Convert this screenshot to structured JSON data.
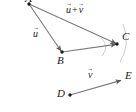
{
  "figure": {
    "type": "vector-addition-diagram",
    "width": 136,
    "height": 112,
    "background": "#ffffff",
    "line_color": "#7a7a7a",
    "arc_color": "#b8b8b8",
    "point_color": "#1a1a1a",
    "text_color": "#1a1a1a"
  },
  "points": [
    {
      "name": "A",
      "label": "A",
      "x": 29,
      "y": 4,
      "label_x": 26,
      "label_y": -6
    },
    {
      "name": "B",
      "label": "B",
      "x": 62,
      "y": 52,
      "label_x": 58,
      "label_y": 54
    },
    {
      "name": "C",
      "label": "C",
      "x": 117,
      "y": 44,
      "label_x": 123,
      "label_y": 31
    },
    {
      "name": "D",
      "label": "D",
      "x": 70,
      "y": 95,
      "label_x": 58,
      "label_y": 87
    },
    {
      "name": "E",
      "label": "E",
      "x": 122,
      "y": 80,
      "label_x": 126,
      "label_y": 70
    }
  ],
  "vectors": [
    {
      "name": "u",
      "from": "A",
      "to": "B",
      "label_plain": "u",
      "label_main": "u",
      "label_x": 33,
      "label_y": 28,
      "arrowhead": true
    },
    {
      "name": "u-plus-v",
      "from": "A",
      "to": "C",
      "label_plain": "u + v",
      "label_main": "u",
      "label_op": "+",
      "label_second": "v",
      "label_x": 66,
      "label_y": 4,
      "arrowhead": true
    },
    {
      "name": "b-to-c",
      "from": "B",
      "to": "C",
      "label_plain": "",
      "arrowhead": true
    },
    {
      "name": "v",
      "from": "D",
      "to": "E",
      "label_plain": "v",
      "label_main": "v",
      "label_x": 88,
      "label_y": 70,
      "arrowhead": true
    }
  ],
  "construction_arcs": [
    {
      "name": "arc-upper-right",
      "d": "M 123 24 Q 131 44 120 62"
    },
    {
      "name": "arc-left",
      "d": "M 101 38 Q 110 46 102 56"
    }
  ]
}
